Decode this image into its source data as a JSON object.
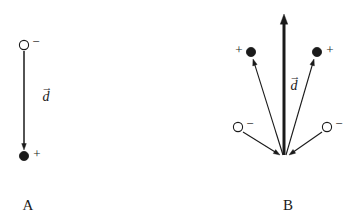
{
  "figure": {
    "width": 356,
    "height": 224,
    "background": "#ffffff",
    "stroke_color": "#1a1a1a",
    "fill_color": "#1a1a1a"
  },
  "panels": [
    {
      "id": "A",
      "label": "A",
      "label_x": 28,
      "label_y": 205,
      "vector_label": {
        "symbol": "d",
        "accent": "→",
        "x": 46,
        "y": 97
      },
      "charges": [
        {
          "kind": "negative",
          "sign": "−",
          "filled": false,
          "cx": 24,
          "cy": 45,
          "r": 4.6,
          "sign_x": 36,
          "sign_y": 42
        },
        {
          "kind": "positive",
          "sign": "+",
          "filled": true,
          "cx": 24,
          "cy": 156,
          "r": 4.6,
          "sign_x": 37,
          "sign_y": 154
        }
      ],
      "arrows": [
        {
          "name": "dipole-vector-a",
          "x1": 24,
          "y1": 51,
          "x2": 24,
          "y2": 150,
          "width": 1.5,
          "head": "end"
        }
      ]
    },
    {
      "id": "B",
      "label": "B",
      "label_x": 288,
      "label_y": 205,
      "vector_label": {
        "symbol": "d",
        "accent": "→",
        "x": 294,
        "y": 86
      },
      "origin": {
        "x": 284,
        "y": 157
      },
      "charges": [
        {
          "kind": "positive",
          "sign": "+",
          "filled": true,
          "cx": 251,
          "cy": 52,
          "r": 4.6,
          "sign_x": 239,
          "sign_y": 50
        },
        {
          "kind": "positive",
          "sign": "+",
          "filled": true,
          "cx": 317,
          "cy": 52,
          "r": 4.6,
          "sign_x": 330,
          "sign_y": 50
        },
        {
          "kind": "negative",
          "sign": "−",
          "filled": false,
          "cx": 238,
          "cy": 127,
          "r": 4.6,
          "sign_x": 250,
          "sign_y": 124
        },
        {
          "kind": "negative",
          "sign": "−",
          "filled": false,
          "cx": 327,
          "cy": 127,
          "r": 4.6,
          "sign_x": 339,
          "sign_y": 124
        }
      ],
      "arrows": [
        {
          "name": "dipole-vector-b-main",
          "x1": 284,
          "y1": 155,
          "x2": 284,
          "y2": 14,
          "width": 3.0,
          "head": "end"
        },
        {
          "name": "arrow-to-left-positive",
          "x1": 283,
          "y1": 155,
          "x2": 253,
          "y2": 59,
          "width": 1.1,
          "head": "end"
        },
        {
          "name": "arrow-to-right-positive",
          "x1": 286,
          "y1": 155,
          "x2": 314,
          "y2": 59,
          "width": 1.1,
          "head": "end"
        },
        {
          "name": "arrow-from-left-negative",
          "x1": 243,
          "y1": 132,
          "x2": 280,
          "y2": 155,
          "width": 1.1,
          "head": "end"
        },
        {
          "name": "arrow-from-right-negative",
          "x1": 322,
          "y1": 132,
          "x2": 289,
          "y2": 155,
          "width": 1.1,
          "head": "end"
        }
      ]
    }
  ]
}
